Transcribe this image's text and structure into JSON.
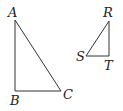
{
  "diagram": {
    "type": "geometry",
    "colors": {
      "stroke": "#333333",
      "text": "#222222",
      "background": "#ffffff"
    },
    "triangles": [
      {
        "name": "ABC",
        "vertices": [
          {
            "label": "A",
            "x": 15,
            "y": 20,
            "label_x": 8,
            "label_y": 17
          },
          {
            "label": "B",
            "x": 15,
            "y": 91,
            "label_x": 10,
            "label_y": 105
          },
          {
            "label": "C",
            "x": 61,
            "y": 91,
            "label_x": 63,
            "label_y": 99
          }
        ],
        "right_angle_at": "B"
      },
      {
        "name": "RST",
        "vertices": [
          {
            "label": "R",
            "x": 109,
            "y": 21,
            "label_x": 103,
            "label_y": 17
          },
          {
            "label": "S",
            "x": 86,
            "y": 56,
            "label_x": 76,
            "label_y": 61
          },
          {
            "label": "T",
            "x": 109,
            "y": 56,
            "label_x": 104,
            "label_y": 70
          }
        ],
        "right_angle_at": "T"
      }
    ]
  }
}
